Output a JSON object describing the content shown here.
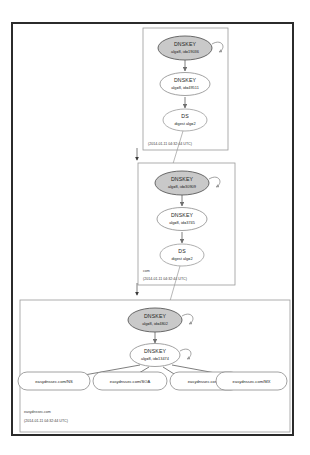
{
  "diagram": {
    "type": "dnssec-chain-of-trust",
    "zones": [
      {
        "id": "root",
        "name": "",
        "timestamp": "(2014-01-11 04:32:44 UTC)",
        "nodes": [
          {
            "role": "ksk",
            "title": "DNSKEY",
            "subtitle": "alg=8, id=19036",
            "self_signed": true
          },
          {
            "role": "zsk",
            "title": "DNSKEY",
            "subtitle": "alg=8, id=49511",
            "self_signed": false
          },
          {
            "role": "ds",
            "title": "DS",
            "subtitle": "digest alg=2",
            "self_signed": false
          }
        ]
      },
      {
        "id": "com",
        "name": "com",
        "timestamp": "(2014-01-11 04:32:44 UTC)",
        "nodes": [
          {
            "role": "ksk",
            "title": "DNSKEY",
            "subtitle": "alg=8, id=30909",
            "self_signed": true
          },
          {
            "role": "zsk",
            "title": "DNSKEY",
            "subtitle": "alg=8, id=3745",
            "self_signed": false
          },
          {
            "role": "ds",
            "title": "DS",
            "subtitle": "digest alg=2",
            "self_signed": false
          }
        ]
      },
      {
        "id": "easydnssec.com",
        "name": "easydnssec.com",
        "timestamp": "(2014-01-11 04:32:44 UTC)",
        "nodes": [
          {
            "role": "ksk",
            "title": "DNSKEY",
            "subtitle": "alg=8, id=4802",
            "self_signed": true
          },
          {
            "role": "zsk",
            "title": "DNSKEY",
            "subtitle": "alg=8, id=13474",
            "self_signed": true
          }
        ],
        "rrsets": [
          {
            "label": "easydnssec.com/NS"
          },
          {
            "label": "easydnssec.com/SOA"
          },
          {
            "label": "easydnssec.com/A"
          },
          {
            "label": "easydnssec.com/MX"
          }
        ]
      }
    ]
  }
}
